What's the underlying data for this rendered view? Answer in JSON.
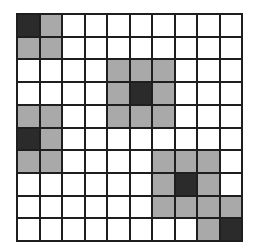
{
  "board": {
    "rows": 10,
    "cols": 10,
    "colors": {
      "dark": "#2b2b2b",
      "gray": "#a9a9a9",
      "empty": "#ffffff",
      "grid_line": "#1e1e1e"
    },
    "legend": {
      "D": "dark",
      "G": "gray",
      ".": "empty"
    },
    "cells": [
      "DG........",
      "GG........",
      "....GGG...",
      "....GDG...",
      "GG..GGG...",
      "DG........",
      "GG....GGG.",
      "......GDG.",
      "......GGGG",
      "........GD"
    ],
    "dark_cells": [
      [
        0,
        0
      ],
      [
        3,
        5
      ],
      [
        5,
        0
      ],
      [
        7,
        7
      ],
      [
        9,
        9
      ]
    ]
  }
}
